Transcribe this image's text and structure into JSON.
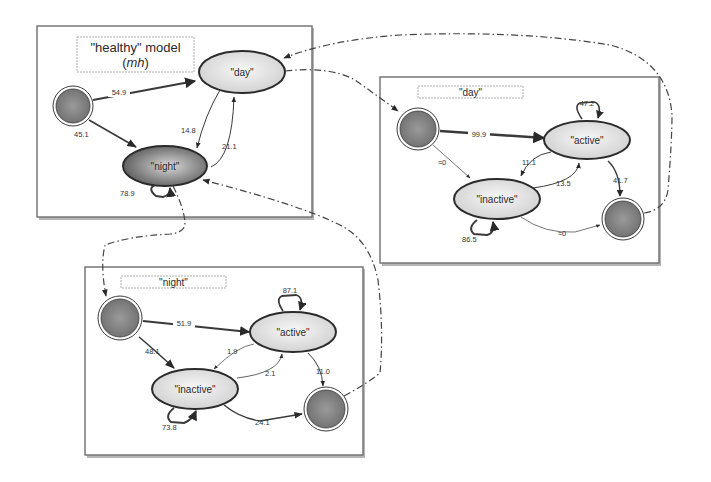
{
  "colors": {
    "state_fill_light": "#e6e6e6",
    "state_fill_dark": "#6a6a6a",
    "terminal_fill": "#7c7c7c",
    "line": "#3a3a3a"
  },
  "panels": {
    "healthy": {
      "title_line1": "\"healthy\" model",
      "title_line2_open": "(",
      "title_line2_italic": "mh",
      "title_line2_close": ")",
      "states": {
        "day": "\"day\"",
        "night": "\"night\""
      },
      "edges": {
        "start_to_day": "54.9",
        "start_to_night": "45.1",
        "day_self": "85.2",
        "day_to_night": "14.8",
        "night_to_day": "21.1",
        "night_self": "78.9"
      }
    },
    "day": {
      "title": "\"day\"",
      "states": {
        "active": "\"active\"",
        "inactive": "\"inactive\""
      },
      "edges": {
        "start_to_active": "99.9",
        "start_to_inactive": "≈0",
        "active_self": "47.2",
        "active_to_inactive": "11.1",
        "inactive_to_active": "13.5",
        "active_to_end": "41.7",
        "inactive_self": "86.5",
        "inactive_to_end": "≈0"
      }
    },
    "night": {
      "title": "\"night\"",
      "states": {
        "active": "\"active\"",
        "inactive": "\"inactive\""
      },
      "edges": {
        "start_to_active": "51.9",
        "start_to_inactive": "48.1",
        "active_self": "87.1",
        "active_to_inactive": "1.9",
        "inactive_to_active": "2.1",
        "active_to_end": "11.0",
        "inactive_self": "73.8",
        "inactive_to_end": "24.1"
      }
    }
  }
}
